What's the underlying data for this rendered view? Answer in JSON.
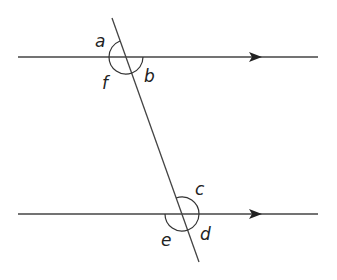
{
  "diagram": {
    "colors": {
      "line": "#444444",
      "text": "#222222",
      "background": "#ffffff"
    },
    "parallel_lines": [
      {
        "name": "top-line",
        "y": 57,
        "x1": 18,
        "x2": 318,
        "arrow_x": 262
      },
      {
        "name": "bottom-line",
        "y": 214,
        "x1": 18,
        "x2": 318,
        "arrow_x": 262
      }
    ],
    "transversal": {
      "x1": 112,
      "y1": 18,
      "x2": 199,
      "y2": 262
    },
    "angle_labels": {
      "a": "a",
      "b": "b",
      "c": "c",
      "d": "d",
      "e": "e",
      "f": "f"
    }
  }
}
